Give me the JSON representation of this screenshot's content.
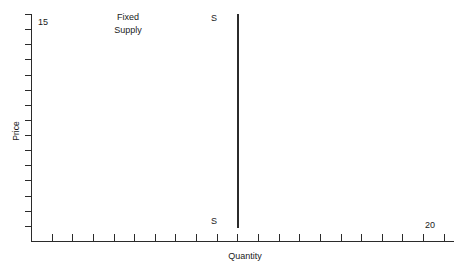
{
  "chart_data": {
    "type": "line",
    "title": "",
    "subtitle": "",
    "xlabel": "Quantity",
    "ylabel": "Price",
    "xlim": [
      0,
      20
    ],
    "ylim": [
      0,
      15
    ],
    "x_max_tick_label": "20",
    "y_max_tick_label": "15",
    "x_tick_count": 20,
    "y_tick_count": 15,
    "grid": false,
    "legend": "none",
    "series": [
      {
        "name": "S",
        "description": "Perfectly inelastic fixed supply: vertical line at quantity 10",
        "x": [
          10,
          10
        ],
        "y": [
          0,
          15
        ],
        "endpoint_labels": [
          "S",
          "S"
        ],
        "color": "#2b2b2b"
      }
    ],
    "annotations": [
      {
        "text": "Fixed\nSupply",
        "x": 5.3,
        "y": 14.3
      }
    ]
  },
  "axes": {
    "y_title": "Price",
    "x_title": "Quantity",
    "y_max_label": "15",
    "x_max_label": "20"
  },
  "curve": {
    "label_top": "S",
    "label_bottom": "S"
  },
  "annotation": {
    "text": "Fixed\nSupply"
  },
  "colors": {
    "ink": "#2b2b2b",
    "background": "#ffffff"
  }
}
